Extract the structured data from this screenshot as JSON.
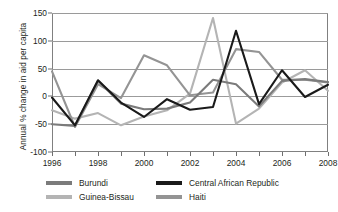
{
  "chart_data": {
    "type": "line",
    "title": "",
    "xlabel": "",
    "ylabel": "Annual % change in aid per capita",
    "x": [
      1996,
      1997,
      1998,
      1999,
      2000,
      2001,
      2002,
      2003,
      2004,
      2005,
      2006,
      2007,
      2008
    ],
    "xlim": [
      1996,
      2008
    ],
    "ylim": [
      -100,
      150
    ],
    "yticks": [
      -100,
      -50,
      0,
      50,
      100,
      150
    ],
    "ytick_labels": [
      "-100",
      "-50",
      "0",
      "50",
      "100",
      "150"
    ],
    "xticks": [
      1996,
      1998,
      2000,
      2002,
      2004,
      2006,
      2008
    ],
    "xtick_labels": [
      "1996",
      "1998",
      "2000",
      "2002",
      "2004",
      "2006",
      "2008"
    ],
    "xminor_ticks": [
      1996,
      1997,
      1998,
      1999,
      2000,
      2001,
      2002,
      2003,
      2004,
      2005,
      2006,
      2007,
      2008
    ],
    "grid": "horizontal",
    "zero_reference_line": 0,
    "legend_position": "bottom",
    "series": [
      {
        "name": "Burundi",
        "color": "#7b7b7b",
        "values": [
          -50,
          -53,
          28,
          -13,
          -23,
          -22,
          -11,
          30,
          22,
          -18,
          28,
          31,
          26
        ]
      },
      {
        "name": "Central African Republic",
        "color": "#1a1a1a",
        "values": [
          -2,
          -52,
          29,
          -11,
          -37,
          -5,
          -24,
          -19,
          118,
          -14,
          47,
          -1,
          21
        ]
      },
      {
        "name": "Guinea-Bissau",
        "color": "#b4b4b4",
        "values": [
          -25,
          -40,
          -30,
          -52,
          -36,
          -25,
          5,
          141,
          -49,
          -22,
          25,
          47,
          10
        ]
      },
      {
        "name": "Haiti",
        "color": "#949494",
        "values": [
          45,
          -55,
          22,
          -3,
          74,
          56,
          2,
          7,
          85,
          80,
          30,
          30,
          25
        ]
      }
    ]
  }
}
